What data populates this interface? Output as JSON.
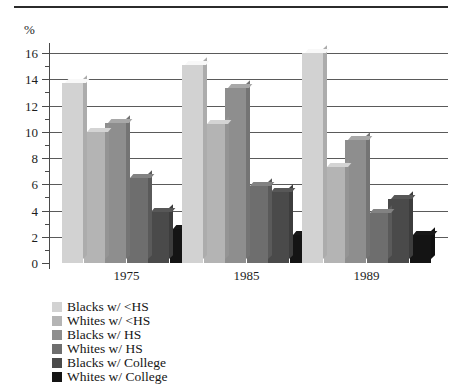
{
  "figure": {
    "axis_unit_label": "%"
  },
  "chart_data": {
    "type": "bar",
    "title": "",
    "subtitle": "",
    "xlabel": "",
    "ylabel": "%",
    "ylim": [
      0,
      16
    ],
    "ytick_step": 2,
    "yticks": [
      16,
      14,
      12,
      10,
      8,
      6,
      4,
      2,
      0
    ],
    "grid": true,
    "legend_position": "bottom-left",
    "categories": [
      "1975",
      "1985",
      "1989"
    ],
    "series": [
      {
        "name": "Blacks w/ <HS",
        "color": "#d2d2d2",
        "values": [
          13.7,
          15.1,
          16.0
        ]
      },
      {
        "name": "Whites w/ <HS",
        "color": "#b4b4b4",
        "values": [
          10.0,
          10.6,
          7.3
        ]
      },
      {
        "name": "Blacks w/ HS",
        "color": "#8e8e8e",
        "values": [
          10.7,
          13.3,
          9.4
        ]
      },
      {
        "name": "Whites w/ HS",
        "color": "#6e6e6e",
        "values": [
          6.5,
          5.9,
          3.8
        ]
      },
      {
        "name": "Blacks w/ College",
        "color": "#4a4a4a",
        "values": [
          3.9,
          5.4,
          4.9
        ]
      },
      {
        "name": "Whites w/ College",
        "color": "#141414",
        "values": [
          2.6,
          2.1,
          2.1
        ]
      }
    ]
  }
}
